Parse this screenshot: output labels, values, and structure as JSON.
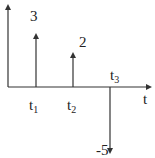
{
  "diagram": {
    "type": "impulse-train",
    "axis_label": "t",
    "stroke_color": "#333333",
    "impulses": [
      {
        "time_label": "t",
        "time_sub": "1",
        "amplitude": 3,
        "amplitude_label": "3"
      },
      {
        "time_label": "t",
        "time_sub": "2",
        "amplitude": 2,
        "amplitude_label": "2"
      },
      {
        "time_label": "t",
        "time_sub": "3",
        "amplitude": -5,
        "amplitude_label": "-5"
      }
    ]
  }
}
